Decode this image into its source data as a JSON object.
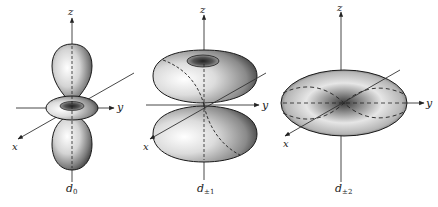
{
  "figure": {
    "panels": [
      {
        "id": "d0",
        "label_main": "d",
        "label_sub": "0",
        "axes": {
          "x": "x",
          "y": "y",
          "z": "z"
        }
      },
      {
        "id": "d_pm1",
        "label_main": "d",
        "label_sub": "±1",
        "axes": {
          "x": "x",
          "y": "y",
          "z": "z"
        }
      },
      {
        "id": "d_pm2",
        "label_main": "d",
        "label_sub": "±2",
        "axes": {
          "x": "x",
          "y": "y",
          "z": "z"
        }
      }
    ]
  },
  "colors": {
    "outline": "#1a1a1a",
    "axis": "#333333",
    "surface_light": "#f2f2f2",
    "surface_dark": "#4a4a4a",
    "background": "#ffffff"
  }
}
